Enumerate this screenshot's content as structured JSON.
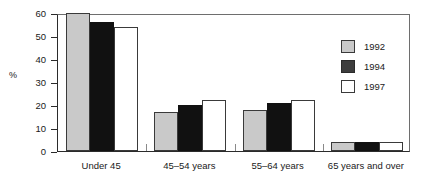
{
  "chart_data": {
    "type": "bar",
    "title": "",
    "xlabel": "",
    "ylabel": "%",
    "ylim": [
      0,
      60
    ],
    "yticks": [
      0,
      10,
      20,
      30,
      40,
      50,
      60
    ],
    "ytick_labels": [
      "0",
      "10",
      "20",
      "30",
      "40",
      "50",
      "60"
    ],
    "grid": false,
    "legend_position": "upper right",
    "categories": [
      "Under 45",
      "45–54 years",
      "55–64 years",
      "65 years and over"
    ],
    "series": [
      {
        "name": "1992",
        "color": "#c9c9c9",
        "values": [
          60,
          17,
          18,
          4
        ]
      },
      {
        "name": "1994",
        "color": "#111111",
        "values": [
          56,
          20,
          21,
          4
        ]
      },
      {
        "name": "1997",
        "color": "#ffffff",
        "values": [
          54,
          22,
          22,
          4
        ]
      }
    ]
  },
  "legend": {
    "entries": [
      {
        "label": "1992"
      },
      {
        "label": "1994"
      },
      {
        "label": "1997"
      }
    ]
  },
  "axis": {
    "y_title": "%"
  }
}
